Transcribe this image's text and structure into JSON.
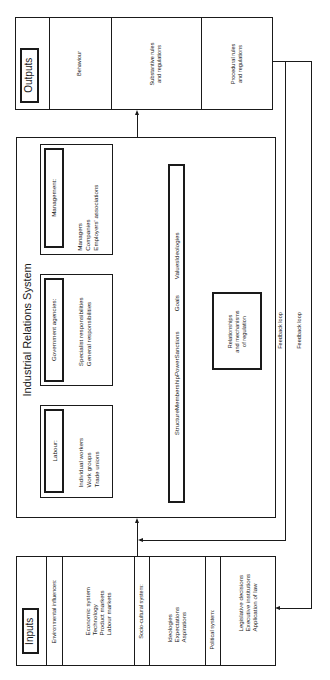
{
  "outputs": {
    "label": "Outputs",
    "items": [
      "Behaviour",
      "Substantive rules\nand regulations",
      "Procedural rules\nand regulations"
    ],
    "behaviour": "Behaviour",
    "substantive_1": "Substantive rules",
    "substantive_2": "and regulations",
    "procedural_1": "Procedural rules",
    "procedural_2": "and regulations"
  },
  "irs": {
    "title": "Industrial Relations System",
    "management": {
      "label": "Management:",
      "items": [
        "Managers",
        "Companies",
        "Employers' associations"
      ]
    },
    "government": {
      "label": "Government agencies:",
      "items": [
        "Specialist responsibilities",
        "General responsibilities"
      ]
    },
    "labour": {
      "label": "Labour:",
      "items": [
        "Individual workers",
        "Work groups",
        "Trade unions"
      ]
    },
    "dimensions": [
      "Structure",
      "Membership",
      "Power",
      "Sanctions",
      "Goals",
      "Values",
      "Ideologies"
    ],
    "relationships": [
      "Relationships",
      "and mechanisms",
      "of regulation"
    ]
  },
  "feedback": {
    "inner_label": "Feedback loop",
    "outer_label": "Feedback loop"
  },
  "inputs": {
    "label": "Inputs",
    "environmental": {
      "label": "Environmental influences:",
      "items": [
        "Economic system",
        "Technology",
        "Product markets",
        "Labour markets"
      ]
    },
    "sociocultural": {
      "label": "Socio-cultural system:",
      "items": [
        "Ideologies",
        "Expectations",
        "Aspirations"
      ]
    },
    "political": {
      "label": "Political system:",
      "items": [
        "Legislative decisions",
        "Executive institutions",
        "Application of law"
      ]
    }
  },
  "colors": {
    "line": "#1a1a1a",
    "background": "#ffffff"
  }
}
